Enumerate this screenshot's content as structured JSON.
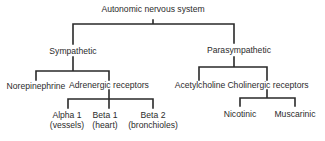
{
  "diagram": {
    "type": "tree",
    "root": {
      "label": "Autonomic nervous system",
      "children": [
        {
          "label": "Sympathetic",
          "children": [
            {
              "label": "Norepinephrine"
            },
            {
              "label": "Adrenergic receptors",
              "children": [
                {
                  "label": "Alpha 1",
                  "sublabel": "(vessels)"
                },
                {
                  "label": "Beta 1",
                  "sublabel": "(heart)"
                },
                {
                  "label": "Beta 2",
                  "sublabel": "(bronchioles)"
                }
              ]
            }
          ]
        },
        {
          "label": "Parasympathetic",
          "children": [
            {
              "label": "Acetylcholine"
            },
            {
              "label": "Cholinergic receptors",
              "children": [
                {
                  "label": "Nicotinic"
                },
                {
                  "label": "Muscarinic"
                }
              ]
            }
          ]
        }
      ]
    },
    "line_color": "#2a2a2a",
    "text_color": "#2b2b2b"
  }
}
